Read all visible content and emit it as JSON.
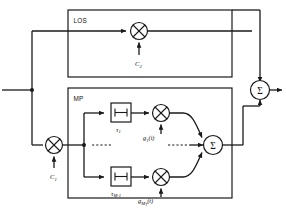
{
  "diagram": {
    "blocks": {
      "los": {
        "label": "LOS"
      },
      "mp": {
        "label": "MP"
      }
    },
    "multipliers": {
      "los_gain": {
        "input_label": "C",
        "input_sub": "2",
        "icon": "multiplier-cross-icon"
      },
      "mp_gain": {
        "input_label": "C",
        "input_sub": "1",
        "icon": "multiplier-cross-icon"
      },
      "tap1_gain": {
        "label": "g",
        "sub": "1",
        "arg": "(t)",
        "icon": "multiplier-cross-icon"
      },
      "tapM_gain": {
        "label": "g",
        "sub": "M",
        "sub2": "T",
        "arg": "(t)",
        "icon": "multiplier-cross-icon"
      }
    },
    "delays": {
      "tap1": {
        "label": "τ",
        "sub": "1",
        "icon": "delay-block-icon"
      },
      "tapM": {
        "label": "τ",
        "sub": "M-1",
        "icon": "delay-block-icon"
      }
    },
    "summers": {
      "mp_sum": {
        "symbol": "Σ",
        "icon": "summation-node-icon"
      },
      "output_sum": {
        "symbol": "Σ",
        "icon": "summation-node-icon"
      }
    },
    "ellipses": {
      "mid_left": "· · ·",
      "mid_right": "· · ·"
    },
    "colors": {
      "line": "#1a1a1a",
      "background": "#ffffff",
      "text": "#111111"
    }
  }
}
